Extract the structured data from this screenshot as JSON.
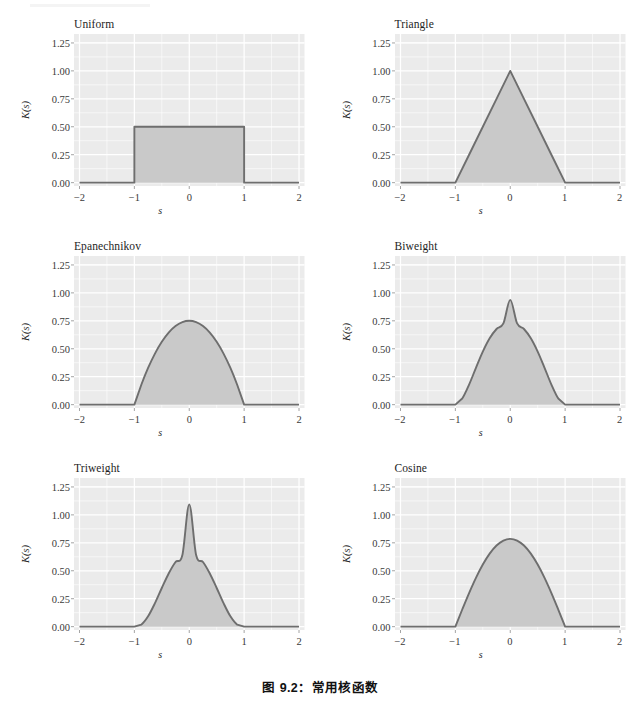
{
  "figure": {
    "caption": "图 9.2：常用核函数",
    "background": "#ffffff",
    "panel_bg": "#ebebeb",
    "grid_color": "#ffffff",
    "line_color": "#6e6e6e",
    "fill_color": "#c9c9c9",
    "tick_color": "#3a3a3a"
  },
  "axes": {
    "xlabel": "s",
    "ylabel": "K(s)",
    "xticks": [
      "−2",
      "−1",
      "0",
      "1",
      "2"
    ],
    "xtick_values": [
      -2,
      -1,
      0,
      1,
      2
    ],
    "yticks": [
      "0.00",
      "0.25",
      "0.50",
      "0.75",
      "1.00",
      "1.25"
    ],
    "ytick_values": [
      0,
      0.25,
      0.5,
      0.75,
      1.0,
      1.25
    ],
    "xlim": [
      -2.1,
      2.1
    ],
    "ylim": [
      -0.03,
      1.33
    ]
  },
  "chart_data": {
    "type": "area",
    "title": "图 9.2：常用核函数",
    "xlabel": "s",
    "ylabel": "K(s)",
    "xlim": [
      -2.1,
      2.1
    ],
    "ylim": [
      -0.03,
      1.33
    ],
    "xticks": [
      -2,
      -1,
      0,
      1,
      2
    ],
    "yticks": [
      0,
      0.25,
      0.5,
      0.75,
      1.0,
      1.25
    ],
    "grid": true,
    "legend": "none",
    "layout": "2 columns x 3 rows",
    "panels": [
      {
        "name": "Uniform",
        "row": 0,
        "col": 0,
        "formula": "0.5 for |s| <= 1, else 0",
        "peak": 0.5,
        "support": [
          -1,
          1
        ],
        "x": [
          -2.0,
          -1.5,
          -1.0001,
          -1,
          -0.75,
          -0.5,
          -0.25,
          0,
          0.25,
          0.5,
          0.75,
          1,
          1.0001,
          1.5,
          2.0
        ],
        "y": [
          0,
          0,
          0,
          0.5,
          0.5,
          0.5,
          0.5,
          0.5,
          0.5,
          0.5,
          0.5,
          0.5,
          0,
          0,
          0
        ]
      },
      {
        "name": "Triangle",
        "row": 0,
        "col": 1,
        "formula": "1 - |s| for |s| <= 1, else 0",
        "peak": 1.0,
        "support": [
          -1,
          1
        ],
        "x": [
          -2.0,
          -1.5,
          -1.0,
          -0.75,
          -0.5,
          -0.25,
          0,
          0.25,
          0.5,
          0.75,
          1.0,
          1.5,
          2.0
        ],
        "y": [
          0,
          0,
          0,
          0.25,
          0.5,
          0.75,
          1.0,
          0.75,
          0.5,
          0.25,
          0,
          0,
          0
        ]
      },
      {
        "name": "Epanechnikov",
        "row": 1,
        "col": 0,
        "formula": "0.75 (1 - s^2) for |s| <= 1, else 0",
        "peak": 0.75,
        "support": [
          -1,
          1
        ],
        "x": [
          -2.0,
          -1.25,
          -1.0,
          -0.875,
          -0.75,
          -0.625,
          -0.5,
          -0.375,
          -0.25,
          -0.125,
          0,
          0.125,
          0.25,
          0.375,
          0.5,
          0.625,
          0.75,
          0.875,
          1.0,
          1.25,
          2.0
        ],
        "y": [
          0,
          0,
          0,
          0.1758,
          0.3281,
          0.457,
          0.5625,
          0.6445,
          0.7031,
          0.7383,
          0.75,
          0.7383,
          0.7031,
          0.6445,
          0.5625,
          0.457,
          0.3281,
          0.1758,
          0,
          0,
          0
        ]
      },
      {
        "name": "Biweight",
        "row": 1,
        "col": 1,
        "formula": "0.9375 (1 - s^2)^2 for |s| <= 1, else 0",
        "peak": 0.9375,
        "support": [
          -1,
          1
        ],
        "x": [
          -2.0,
          -1.25,
          -1.0,
          -0.875,
          -0.75,
          -0.625,
          -0.5,
          -0.375,
          -0.25,
          -0.125,
          0,
          0.125,
          0.25,
          0.375,
          0.5,
          0.625,
          0.75,
          0.875,
          1.0,
          1.25,
          2.0
        ],
        "y": [
          0,
          0,
          0,
          0.0549,
          0.1794,
          0.3295,
          0.4746,
          0.5936,
          0.6768,
          0.7268,
          0.9375,
          0.7268,
          0.6768,
          0.5936,
          0.4746,
          0.3295,
          0.1794,
          0.0549,
          0,
          0,
          0
        ]
      },
      {
        "name": "Triweight",
        "row": 2,
        "col": 0,
        "formula": "1.09375 (1 - s^2)^3 for |s| <= 1, else 0",
        "peak": 1.0938,
        "support": [
          -1,
          1
        ],
        "x": [
          -2.0,
          -1.25,
          -1.0,
          -0.875,
          -0.75,
          -0.625,
          -0.5,
          -0.375,
          -0.25,
          -0.125,
          0,
          0.125,
          0.25,
          0.375,
          0.5,
          0.625,
          0.75,
          0.875,
          1.0,
          1.25,
          2.0
        ],
        "y": [
          0,
          0,
          0,
          0.0178,
          0.0925,
          0.2097,
          0.3457,
          0.4757,
          0.5784,
          0.6406,
          1.0938,
          0.6406,
          0.5784,
          0.4757,
          0.3457,
          0.2097,
          0.0925,
          0.0178,
          0,
          0,
          0
        ]
      },
      {
        "name": "Cosine",
        "row": 2,
        "col": 1,
        "formula": "(pi/4) cos(pi s / 2) for |s| <= 1, else 0",
        "peak": 0.7854,
        "support": [
          -1,
          1
        ],
        "x": [
          -2.0,
          -1.25,
          -1.0,
          -0.875,
          -0.75,
          -0.625,
          -0.5,
          -0.375,
          -0.25,
          -0.125,
          0,
          0.125,
          0.25,
          0.375,
          0.5,
          0.625,
          0.75,
          0.875,
          1.0,
          1.25,
          2.0
        ],
        "y": [
          0,
          0,
          0,
          0.1532,
          0.3005,
          0.4363,
          0.5554,
          0.6533,
          0.7256,
          0.77,
          0.7854,
          0.77,
          0.7256,
          0.6533,
          0.5554,
          0.4363,
          0.3005,
          0.1532,
          0,
          0,
          0
        ]
      }
    ]
  }
}
